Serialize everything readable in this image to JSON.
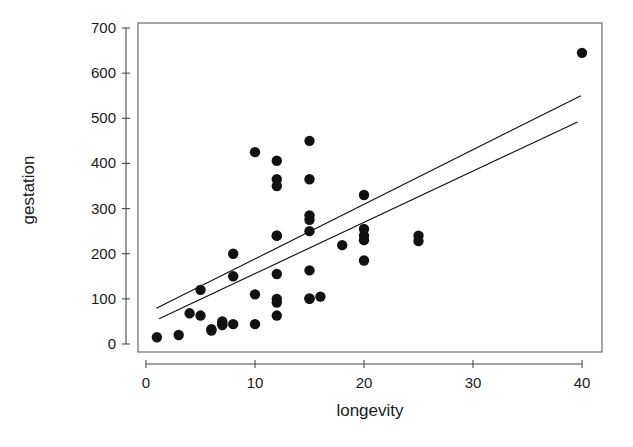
{
  "chart_data": {
    "type": "scatter",
    "title": "",
    "xlabel": "longevity",
    "ylabel": "gestation",
    "xlim": [
      -1.5,
      42.5
    ],
    "ylim": [
      -25,
      710
    ],
    "grid": false,
    "legend": null,
    "xticks": [
      0,
      10,
      20,
      30,
      40
    ],
    "xtick_labels": [
      "0",
      "10",
      "20",
      "30",
      "40"
    ],
    "yticks": [
      0,
      100,
      200,
      300,
      400,
      500,
      600,
      700
    ],
    "ytick_labels": [
      "0",
      "100",
      "200",
      "300",
      "400",
      "500",
      "600",
      "700"
    ],
    "point_color": "#111111",
    "line_color": "#111111",
    "marker_radius_px": 5.2,
    "x": [
      1,
      3,
      4,
      5,
      5,
      6,
      6,
      7,
      7,
      7,
      8,
      8,
      8,
      10,
      10,
      10,
      12,
      12,
      12,
      12,
      12,
      12,
      12,
      12,
      12,
      15,
      15,
      15,
      15,
      15,
      15,
      15,
      15,
      16,
      18,
      20,
      20,
      20,
      20,
      20,
      25,
      25,
      40
    ],
    "y": [
      15,
      20,
      68,
      120,
      63,
      30,
      33,
      45,
      50,
      42,
      200,
      150,
      44,
      425,
      110,
      44,
      406,
      365,
      350,
      240,
      155,
      100,
      92,
      63,
      240,
      450,
      365,
      285,
      275,
      250,
      163,
      100,
      101,
      105,
      219,
      330,
      255,
      240,
      230,
      185,
      240,
      228,
      645
    ],
    "lines": [
      {
        "name": "fit-line-upper",
        "x0": 0.95,
        "y0": 79,
        "x1": 39.9,
        "y1": 550
      },
      {
        "name": "fit-line-lower",
        "x0": 1.2,
        "y0": 56,
        "x1": 39.6,
        "y1": 492
      }
    ]
  },
  "axes": {
    "x_title": "longevity",
    "y_title": "gestation"
  }
}
